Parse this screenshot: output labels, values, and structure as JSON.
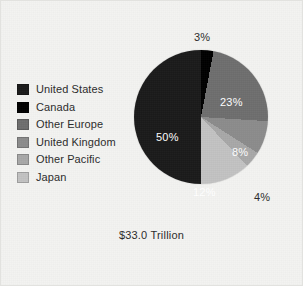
{
  "chart_data": {
    "type": "pie",
    "title": "",
    "caption": "$33.0 Trillion",
    "legend_position": "left",
    "grid": false,
    "categories": [
      "United States",
      "Canada",
      "Other Europe",
      "United Kingdom",
      "Other Pacific",
      "Japan"
    ],
    "values": [
      50,
      3,
      23,
      8,
      4,
      12
    ],
    "value_labels": [
      "50%",
      "3%",
      "23%",
      "8%",
      "4%",
      "12%"
    ],
    "colors": [
      "#1a1a1a",
      "#000000",
      "#6e6e6e",
      "#8c8c8c",
      "#a8a8a8",
      "#c2c2c2"
    ],
    "label_placement": [
      "inside",
      "outside",
      "inside",
      "inside",
      "outside",
      "inside"
    ],
    "start_angle_deg": 0,
    "direction": "clockwise",
    "slice_order_clockwise_from_top": [
      "Canada",
      "Other Europe",
      "United Kingdom",
      "Other Pacific",
      "Japan",
      "United States"
    ],
    "total": 100
  },
  "legend": {
    "items": [
      {
        "label": "United States",
        "color": "#1a1a1a"
      },
      {
        "label": "Canada",
        "color": "#000000"
      },
      {
        "label": "Other Europe",
        "color": "#6e6e6e"
      },
      {
        "label": "United Kingdom",
        "color": "#8c8c8c"
      },
      {
        "label": "Other Pacific",
        "color": "#a8a8a8"
      },
      {
        "label": "Japan",
        "color": "#c2c2c2"
      }
    ]
  },
  "labels": {
    "united_states": "50%",
    "canada": "3%",
    "other_europe": "23%",
    "united_kingdom": "8%",
    "other_pacific": "4%",
    "japan": "12%"
  },
  "caption": "$33.0 Trillion"
}
